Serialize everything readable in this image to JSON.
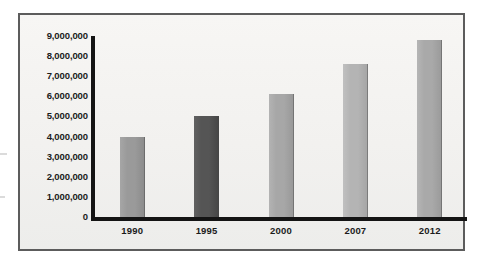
{
  "chart_data": {
    "type": "bar",
    "title": "",
    "subtitle": "",
    "xlabel": "",
    "ylabel": "",
    "categories": [
      "1990",
      "1995",
      "2000",
      "2007",
      "2012"
    ],
    "values": [
      4000000,
      5000000,
      6100000,
      7600000,
      8800000
    ],
    "series": [
      {
        "name": "",
        "values": [
          4000000,
          5000000,
          6100000,
          7600000,
          8800000
        ]
      }
    ],
    "ylim": [
      0,
      9000000
    ],
    "ytick_labels": [
      "9,000,000",
      "8,000,000",
      "7,000,000",
      "6,000,000",
      "5,000,000",
      "4,000,000",
      "3,000,000",
      "2,000,000",
      "1,000,000",
      "0"
    ],
    "ytick_values": [
      9000000,
      8000000,
      7000000,
      6000000,
      5000000,
      4000000,
      3000000,
      2000000,
      1000000,
      0
    ],
    "xtick_labels": [
      "1990",
      "1995",
      "2000",
      "2007",
      "2012"
    ],
    "grid": false,
    "legend": "none",
    "bar_colors": [
      "#9a9a9a",
      "#555555",
      "#a7a7a7",
      "#b4b4b4",
      "#a9a9a9"
    ],
    "axis_color": "#141414",
    "plot_background": "#f2f1ef",
    "frame_border_color": "#5c5c5c",
    "annotations": []
  }
}
